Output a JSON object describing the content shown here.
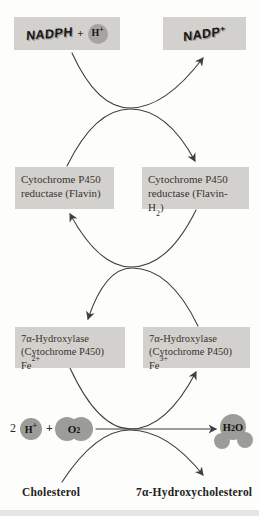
{
  "colors": {
    "background": "#fdfdfb",
    "box_bg": "#d2d1cd",
    "box_text": "#3a332d",
    "arrow": "#3e3e3e",
    "molecule_gray": "#9c9c99"
  },
  "boxes": {
    "nadph": {
      "text": "NADPH",
      "plus": "+",
      "h": "H",
      "h_sup": "+"
    },
    "nadp": {
      "text": "NADP",
      "sup": "+"
    },
    "reductase_flavin": {
      "line1": "Cytochrome P450",
      "line2": "reductase (Flavin)"
    },
    "reductase_flavin_h2": {
      "line1": "Cytochrome P450",
      "line2_pre": "reductase (Flavin-H",
      "line2_sub": "2",
      "line2_post": ")"
    },
    "hydroxylase_fe2": {
      "line1": "7α-Hydroxylase",
      "line2": "(Cytochrome P450)",
      "line3": "Fe",
      "line3_sup": "2+"
    },
    "hydroxylase_fe3": {
      "line1": "7α-Hydroxylase",
      "line2": "(Cytochrome P450)",
      "line3": "Fe",
      "line3_sup": "3+"
    }
  },
  "reaction": {
    "coefficient": "2",
    "h_plus": {
      "base": "H",
      "sup": "+"
    },
    "plus": "+",
    "o2": {
      "base": "O",
      "sub": "2"
    },
    "h2o": {
      "h": "H",
      "sub": "2",
      "o": "O"
    }
  },
  "substrates": {
    "cholesterol": "Cholesterol",
    "hydroxycholesterol": "7α-Hydroxycholesterol"
  }
}
